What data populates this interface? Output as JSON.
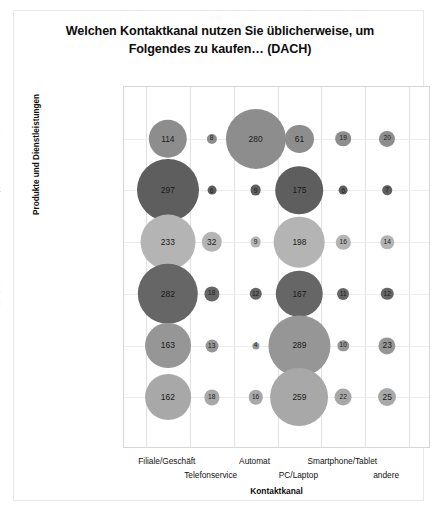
{
  "chart_data": {
    "type": "bubble",
    "title": "Welchen Kontaktkanal nutzen Sie üblicherweise, um Folgendes zu kaufen… (DACH)",
    "title_line1": "Welchen Kontaktkanal nutzen Sie üblicherweise, um",
    "title_line2": "Folgendes zu kaufen… (DACH)",
    "xlabel": "Kontaktkanal",
    "ylabel": "Produkte und Dienstleistungen",
    "grid": true,
    "legend": "none",
    "categories": [
      "Filiale/Geschäft",
      "Telefonservice",
      "Automat",
      "PC/Laptop",
      "Smartphone/Tablet",
      "andere"
    ],
    "rows": [
      {
        "label": "…einen Fahrschein (ÖV)",
        "label_line1": "…einen Fahrschein",
        "label_line2": "(ÖV)",
        "color": "#8d8d8d",
        "values": [
          114,
          8,
          280,
          61,
          19,
          20
        ]
      },
      {
        "label": "…ein Haushaltsgerät",
        "label_line1": "…ein Haushaltsgerät",
        "label_line2": "",
        "color": "#5e5e5e",
        "values": [
          297,
          6,
          9,
          175,
          6,
          7
        ]
      },
      {
        "label": "…einen Mobilfunkvertrag",
        "label_line1": "…einen",
        "label_line2": "Mobilfunkvertrag",
        "color": "#b4b4b4",
        "values": [
          233,
          32,
          9,
          198,
          16,
          14
        ]
      },
      {
        "label": "…eine Bankdienstleistung/Versicherung",
        "label_line1": "…eine",
        "label_line2": "Bankdienstleistung/Ver",
        "label_line3": "sicherung",
        "color": "#666666",
        "values": [
          282,
          18,
          12,
          167,
          11,
          12
        ]
      },
      {
        "label": "…eine Urlaubsreise",
        "label_line1": "…eine Urlaubsreise",
        "label_line2": "",
        "color": "#969696",
        "values": [
          163,
          13,
          4,
          289,
          10,
          23
        ]
      },
      {
        "label": "…eine Eintrittskarte",
        "label_line1": "…eine Eintrittskarte",
        "label_line2": "",
        "color": "#a8a8a8",
        "values": [
          162,
          18,
          16,
          259,
          22,
          25
        ]
      }
    ]
  }
}
